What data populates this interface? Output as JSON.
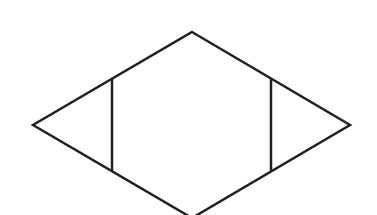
{
  "diagram": {
    "title": "",
    "stroke_color": "#222222",
    "background_color": "#ffffff",
    "stroke_width": 2.5,
    "rhombus": {
      "top": [
        192,
        32
      ],
      "right": [
        350,
        125
      ],
      "bottom": [
        192,
        218
      ],
      "left": [
        33,
        125
      ]
    },
    "segments": [
      {
        "name": "left-vertical",
        "from": [
          112,
          79
        ],
        "to": [
          112,
          171
        ]
      },
      {
        "name": "right-vertical",
        "from": [
          271,
          79
        ],
        "to": [
          271,
          172
        ]
      }
    ]
  }
}
